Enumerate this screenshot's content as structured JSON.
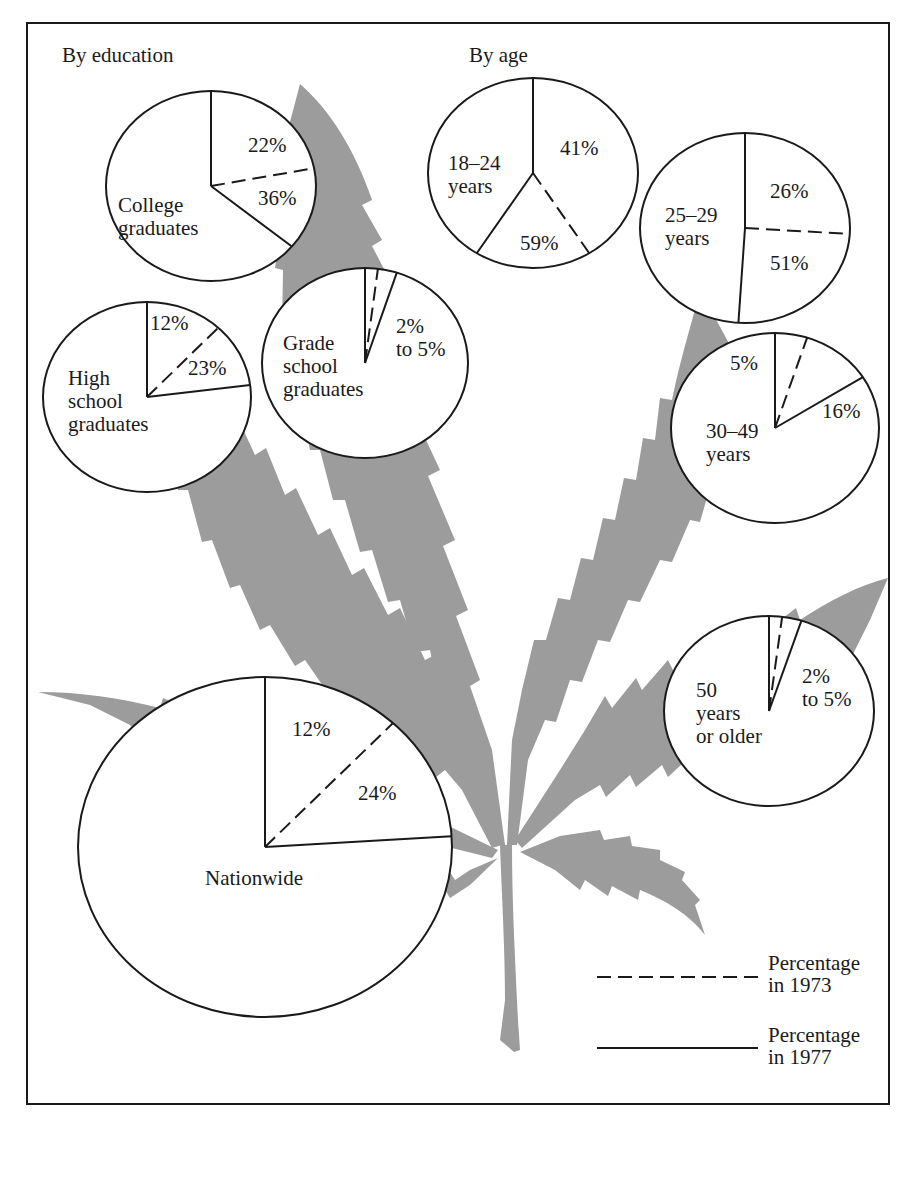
{
  "chart_data": {
    "type": "pie",
    "title": "",
    "section_headings": {
      "education": "By education",
      "age": "By age"
    },
    "legend": {
      "placement": "bottom-right",
      "entries": [
        {
          "style": "dashed",
          "line1": "Percentage",
          "line2": "in 1973"
        },
        {
          "style": "solid",
          "line1": "Percentage",
          "line2": "in 1977"
        }
      ]
    },
    "pies": [
      {
        "id": "college",
        "group": "education",
        "name_lines": [
          "College",
          "graduates"
        ],
        "pct_1973": 22,
        "pct_1977": 36,
        "label_1973": "22%",
        "label_1977": "36%"
      },
      {
        "id": "high-school",
        "group": "education",
        "name_lines": [
          "High",
          "school",
          "graduates"
        ],
        "pct_1973": 12,
        "pct_1977": 23,
        "label_1973": "12%",
        "label_1977": "23%"
      },
      {
        "id": "grade-school",
        "group": "education",
        "name_lines": [
          "Grade",
          "school",
          "graduates"
        ],
        "pct_1973": 2,
        "pct_1977": 5,
        "label_range": [
          "2%",
          "to 5%"
        ]
      },
      {
        "id": "age-18-24",
        "group": "age",
        "name_lines": [
          "18–24",
          "years"
        ],
        "pct_1973": 41,
        "pct_1977": 59,
        "label_1973": "41%",
        "label_1977": "59%"
      },
      {
        "id": "age-25-29",
        "group": "age",
        "name_lines": [
          "25–29",
          "years"
        ],
        "pct_1973": 26,
        "pct_1977": 51,
        "label_1973": "26%",
        "label_1977": "51%"
      },
      {
        "id": "age-30-49",
        "group": "age",
        "name_lines": [
          "30–49",
          "years"
        ],
        "pct_1973": 5,
        "pct_1977": 16,
        "label_1973": "5%",
        "label_1977": "16%"
      },
      {
        "id": "age-50-plus",
        "group": "age",
        "name_lines": [
          "50",
          "years",
          "or older"
        ],
        "pct_1973": 2,
        "pct_1977": 5,
        "label_range": [
          "2%",
          "to 5%"
        ]
      },
      {
        "id": "nationwide",
        "group": "overall",
        "name_lines": [
          "Nationwide"
        ],
        "pct_1973": 12,
        "pct_1977": 24,
        "label_1973": "12%",
        "label_1977": "24%"
      }
    ],
    "colors": {
      "leaf": "#9c9c9c",
      "ink": "#1a1a1a",
      "background": "#ffffff"
    }
  }
}
